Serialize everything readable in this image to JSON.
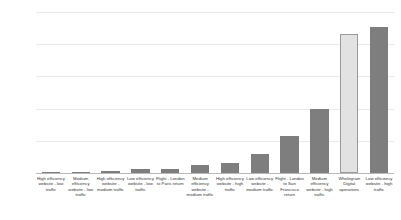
{
  "chart_data": {
    "type": "bar",
    "title": "",
    "subtitle": "",
    "xlabel": "",
    "ylabel": "CO₂ (kg)",
    "ylim": [
      0,
      12500
    ],
    "yticks": [
      0,
      2500,
      5000,
      7500,
      10000,
      12500
    ],
    "ytick_labels": [
      "0",
      "2500",
      "5000",
      "7500",
      "10000",
      "12500"
    ],
    "grid": true,
    "legend": "none",
    "highlight_category": "Wholegrain Digital operations",
    "colors": {
      "bar": "#7e7e7e",
      "bar_highlight": "#e2e2e2",
      "bar_highlight_border": "#9a9a9a",
      "gridline": "#e9e9e9",
      "axis": "#b9b9b9",
      "tick_text": "#666666",
      "label_text": "#333333",
      "background": "#ffffff"
    },
    "categories": [
      "High efficiency website - low traffic",
      "Medium efficiency website - low traffic",
      "High efficiency website - medium traffic",
      "Low efficiency website - low traffic",
      "Flight - London to Paris return",
      "Medium efficiency website - medium traffic",
      "High efficiency website - high traffic",
      "Low efficiency website - medium traffic",
      "Flight - London to San Francisco return",
      "Medium efficiency website - high traffic",
      "Wholegrain Digital operations",
      "Low efficiency website - high traffic"
    ],
    "values": [
      30,
      60,
      150,
      300,
      350,
      600,
      750,
      1500,
      2900,
      4950,
      10800,
      11300
    ]
  }
}
